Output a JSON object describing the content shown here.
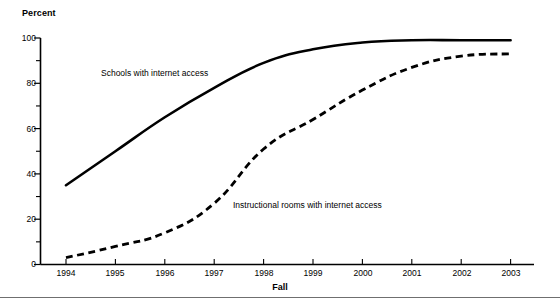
{
  "chart_data": {
    "type": "line",
    "title": "",
    "xlabel": "Fall",
    "ylabel": "Percent",
    "x": [
      1994,
      1995,
      1996,
      1997,
      1998,
      1999,
      2000,
      2001,
      2002,
      2003
    ],
    "xtick_labels": [
      "1994",
      "1995",
      "1996",
      "1997",
      "1998",
      "1999",
      "2000",
      "2001",
      "2002",
      "2003"
    ],
    "ytick_labels": [
      "0",
      "20",
      "40",
      "60",
      "80",
      "100"
    ],
    "ytick_values": [
      0,
      20,
      40,
      60,
      80,
      100
    ],
    "yminor_values": [
      10,
      30,
      50,
      70,
      90
    ],
    "ylim": [
      0,
      100
    ],
    "grid": false,
    "legend_position": "inline-annotations",
    "series": [
      {
        "name": "Schools with internet access",
        "style": "solid",
        "color": "#000000",
        "values": [
          35,
          50,
          65,
          78,
          89,
          95,
          98,
          99,
          99,
          99
        ]
      },
      {
        "name": "Instructional rooms with internet access",
        "style": "dashed",
        "color": "#000000",
        "values": [
          3,
          8,
          14,
          27,
          51,
          64,
          77,
          87,
          92,
          93
        ]
      }
    ],
    "annotations": [
      {
        "text": "Schools with internet access",
        "x": 1994.7,
        "y": 83
      },
      {
        "text": "Instructional rooms with internet access",
        "x": 1997.4,
        "y": 25
      }
    ]
  },
  "axis": {
    "y_title": "Percent",
    "x_title": "Fall"
  }
}
